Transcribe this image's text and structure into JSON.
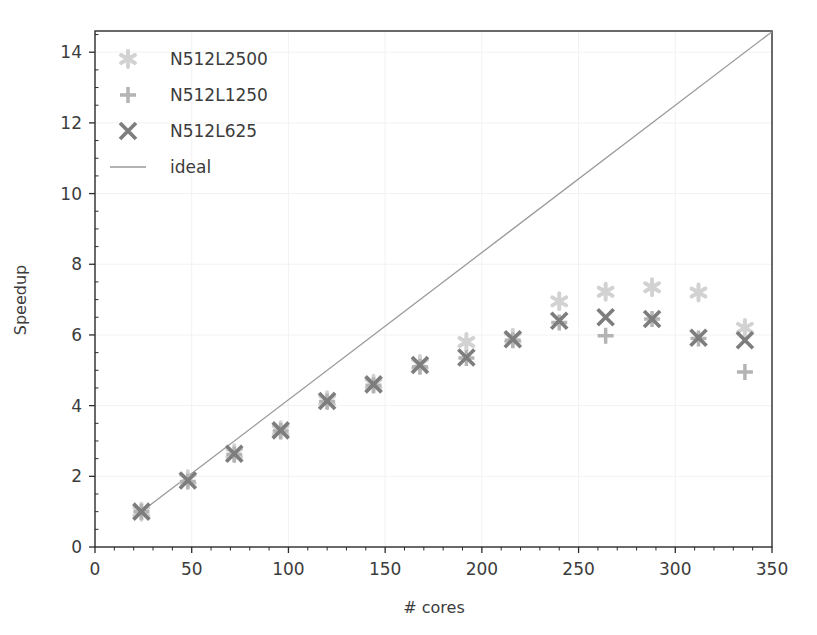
{
  "chart_data": {
    "type": "scatter",
    "title": "",
    "xlabel": "# cores",
    "ylabel": "Speedup",
    "xlim": [
      0,
      350
    ],
    "ylim": [
      0,
      14.6
    ],
    "xticks": [
      0,
      50,
      100,
      150,
      200,
      250,
      300,
      350
    ],
    "yticks": [
      0,
      2,
      4,
      6,
      8,
      10,
      12,
      14
    ],
    "xtick_labels": [
      "0",
      "50",
      "100",
      "150",
      "200",
      "250",
      "300",
      "350"
    ],
    "ytick_labels": [
      "0",
      "2",
      "4",
      "6",
      "8",
      "10",
      "12",
      "14"
    ],
    "minor_ticks": true,
    "grid": true,
    "grid_style": "very-faint-dotted",
    "legend_position": "upper-left",
    "series": [
      {
        "name": "N512L2500",
        "marker": "star",
        "color": "#d2d2d2",
        "points": [
          {
            "x": 24,
            "y": 1.0
          },
          {
            "x": 48,
            "y": 1.92
          },
          {
            "x": 72,
            "y": 2.65
          },
          {
            "x": 96,
            "y": 3.3
          },
          {
            "x": 120,
            "y": 4.15
          },
          {
            "x": 144,
            "y": 4.62
          },
          {
            "x": 168,
            "y": 5.18
          },
          {
            "x": 192,
            "y": 5.8
          },
          {
            "x": 216,
            "y": 5.92
          },
          {
            "x": 240,
            "y": 6.95
          },
          {
            "x": 264,
            "y": 7.22
          },
          {
            "x": 288,
            "y": 7.35
          },
          {
            "x": 312,
            "y": 7.2
          },
          {
            "x": 336,
            "y": 6.2
          }
        ]
      },
      {
        "name": "N512L1250",
        "marker": "plus",
        "color": "#b4b4b4",
        "points": [
          {
            "x": 24,
            "y": 1.0
          },
          {
            "x": 48,
            "y": 1.85
          },
          {
            "x": 72,
            "y": 2.62
          },
          {
            "x": 96,
            "y": 3.28
          },
          {
            "x": 120,
            "y": 4.12
          },
          {
            "x": 144,
            "y": 4.58
          },
          {
            "x": 168,
            "y": 5.1
          },
          {
            "x": 192,
            "y": 5.35
          },
          {
            "x": 216,
            "y": 5.85
          },
          {
            "x": 240,
            "y": 6.35
          },
          {
            "x": 264,
            "y": 5.98
          },
          {
            "x": 288,
            "y": 6.45
          },
          {
            "x": 312,
            "y": 5.9
          },
          {
            "x": 336,
            "y": 4.95
          }
        ]
      },
      {
        "name": "N512L625",
        "marker": "x",
        "color": "#7d7d7d",
        "points": [
          {
            "x": 24,
            "y": 1.0
          },
          {
            "x": 48,
            "y": 1.88
          },
          {
            "x": 72,
            "y": 2.64
          },
          {
            "x": 96,
            "y": 3.3
          },
          {
            "x": 120,
            "y": 4.13
          },
          {
            "x": 144,
            "y": 4.6
          },
          {
            "x": 168,
            "y": 5.15
          },
          {
            "x": 192,
            "y": 5.36
          },
          {
            "x": 216,
            "y": 5.88
          },
          {
            "x": 240,
            "y": 6.4
          },
          {
            "x": 264,
            "y": 6.5
          },
          {
            "x": 288,
            "y": 6.45
          },
          {
            "x": 312,
            "y": 5.92
          },
          {
            "x": 336,
            "y": 5.85
          }
        ]
      },
      {
        "name": "ideal",
        "marker": "line",
        "color": "#9a9a9a",
        "line": [
          {
            "x": 24,
            "y": 1.0
          },
          {
            "x": 350,
            "y": 14.58
          }
        ]
      }
    ]
  },
  "legend": {
    "items": [
      {
        "label": "N512L2500",
        "marker": "star",
        "color": "#d2d2d2"
      },
      {
        "label": "N512L1250",
        "marker": "plus",
        "color": "#b4b4b4"
      },
      {
        "label": "N512L625",
        "marker": "x",
        "color": "#7d7d7d"
      },
      {
        "label": "ideal",
        "marker": "line",
        "color": "#9a9a9a"
      }
    ]
  },
  "axes": {
    "x_title": "# cores",
    "y_title": "Speedup"
  },
  "colors": {
    "axis": "#2b2b2b",
    "text": "#3c3c3c",
    "grid": "#f2f2f2",
    "background": "#ffffff"
  }
}
